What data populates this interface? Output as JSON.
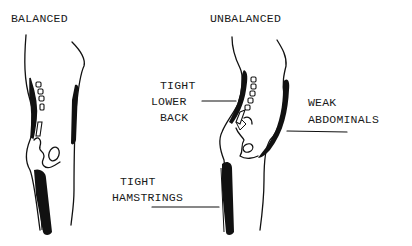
{
  "diagram": {
    "colors": {
      "ink": "#111111",
      "background": "#ffffff"
    },
    "panels": [
      {
        "title": "BALANCED"
      },
      {
        "title": "UNBALANCED"
      }
    ],
    "labels": {
      "tight_lower_back": [
        "TIGHT",
        "LOWER",
        "BACK"
      ],
      "weak_abdominals": [
        "WEAK",
        "ABDOMINALS"
      ],
      "tight_hamstrings": [
        "TIGHT",
        "HAMSTRINGS"
      ]
    }
  }
}
